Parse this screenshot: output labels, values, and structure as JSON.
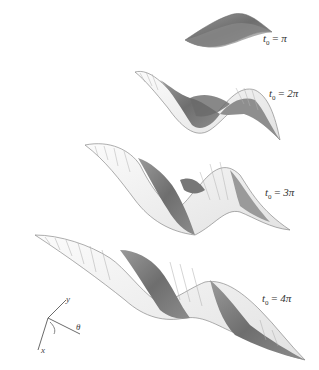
{
  "figure": {
    "type": "3d-surface-sequence",
    "panels": [
      {
        "label_var": "t",
        "label_sub": "0",
        "label_eq": " = ",
        "label_val": "π",
        "text": "t₀ = π"
      },
      {
        "label_var": "t",
        "label_sub": "0",
        "label_eq": " = ",
        "label_val": "2π",
        "text": "t₀ = 2π"
      },
      {
        "label_var": "t",
        "label_sub": "0",
        "label_eq": " = ",
        "label_val": "3π",
        "text": "t₀ = 3π"
      },
      {
        "label_var": "t",
        "label_sub": "0",
        "label_eq": " = ",
        "label_val": "4π",
        "text": "t₀ = 4π"
      }
    ],
    "axes": {
      "x": "x",
      "y": "y",
      "theta": "θ"
    },
    "colors": {
      "light_surface": "#f2f2f2",
      "dark_surface": "#7a7a7a",
      "mesh_line": "#9a9a9a",
      "outline": "#6a6a6a"
    }
  }
}
